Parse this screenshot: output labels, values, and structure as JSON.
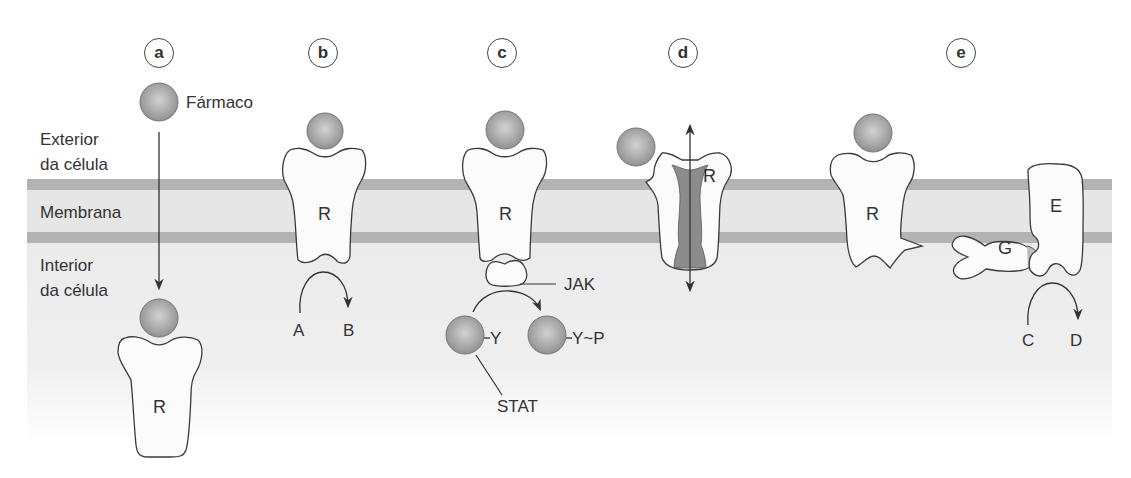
{
  "figure": {
    "panels": [
      {
        "id": "a",
        "label": "a"
      },
      {
        "id": "b",
        "label": "b"
      },
      {
        "id": "c",
        "label": "c"
      },
      {
        "id": "d",
        "label": "d"
      },
      {
        "id": "e",
        "label": "e"
      }
    ],
    "regions": {
      "exterior_line1": "Exterior",
      "exterior_line2": "da célula",
      "membrane": "Membrana",
      "interior_line1": "Interior",
      "interior_line2": "da célula"
    },
    "drug_label": "Fármaco",
    "receptor_label": "R",
    "panel_b": {
      "substrate": "A",
      "product": "B"
    },
    "panel_c": {
      "kinase": "JAK",
      "stat_left": "Y",
      "stat_right": "Y~P",
      "stat_label": "STAT"
    },
    "panel_e": {
      "g_protein": "G",
      "effector": "E",
      "substrate": "C",
      "product": "D"
    },
    "colors": {
      "membrane_band": "#b3b3b3",
      "membrane_fill": "#e6e6e6",
      "interior_fill": "#ececec",
      "drug_sphere": "#9a9a9a",
      "channel_pore": "#8c8c8c",
      "outline": "#3a3a3a"
    }
  }
}
